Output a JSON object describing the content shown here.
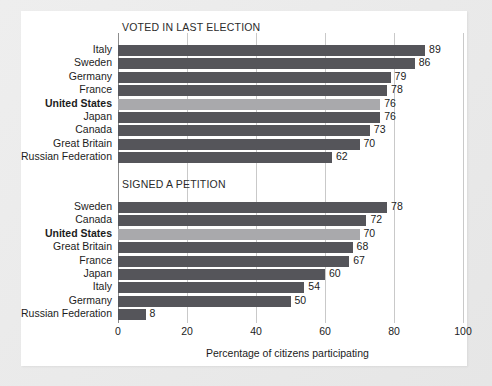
{
  "chart_data": {
    "type": "bar",
    "orientation": "horizontal",
    "title": "",
    "xlabel": "Percentage of citizens participating",
    "ylabel": "",
    "xlim": [
      0,
      100
    ],
    "xticks": [
      0,
      20,
      40,
      60,
      80,
      100
    ],
    "xtick_labels": [
      "0",
      "20",
      "40",
      "60",
      "80",
      "100"
    ],
    "grid": true,
    "legend": "none",
    "highlight_category": "United States",
    "colors": {
      "bar": "#55555a",
      "bar_highlight": "#a9a9ac",
      "gridline": "#c9c9c9",
      "axis": "#8d8d8d",
      "text": "#1c1c1c",
      "panel": "#ffffff",
      "background": "#e8e8e8"
    },
    "panels": [
      {
        "title": "VOTED IN LAST ELECTION",
        "categories": [
          "Italy",
          "Sweden",
          "Germany",
          "France",
          "United States",
          "Japan",
          "Canada",
          "Great Britain",
          "Russian Federation"
        ],
        "values": [
          89,
          86,
          79,
          78,
          76,
          76,
          73,
          70,
          62
        ],
        "value_labels": [
          "89",
          "86",
          "79",
          "78",
          "76",
          "76",
          "73",
          "70",
          "62"
        ]
      },
      {
        "title": "SIGNED A PETITION",
        "categories": [
          "Sweden",
          "Canada",
          "United States",
          "Great Britain",
          "France",
          "Japan",
          "Italy",
          "Germany",
          "Russian Federation"
        ],
        "values": [
          78,
          72,
          70,
          68,
          67,
          60,
          54,
          50,
          8
        ],
        "value_labels": [
          "78",
          "72",
          "70",
          "68",
          "67",
          "60",
          "54",
          "50",
          "8"
        ]
      }
    ]
  }
}
